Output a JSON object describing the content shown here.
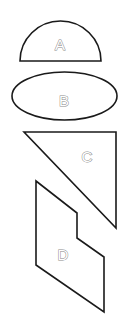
{
  "diagram": {
    "shapes": [
      {
        "id": "A",
        "kind": "semicircle",
        "label": "A"
      },
      {
        "id": "B",
        "kind": "ellipse",
        "label": "B"
      },
      {
        "id": "C",
        "kind": "right-triangle",
        "label": "C"
      },
      {
        "id": "D",
        "kind": "stepped-parallelogram",
        "label": "D"
      }
    ],
    "colors": {
      "stroke": "#1a1a1a",
      "label": "#8a8a8a",
      "background": "#ffffff"
    }
  }
}
